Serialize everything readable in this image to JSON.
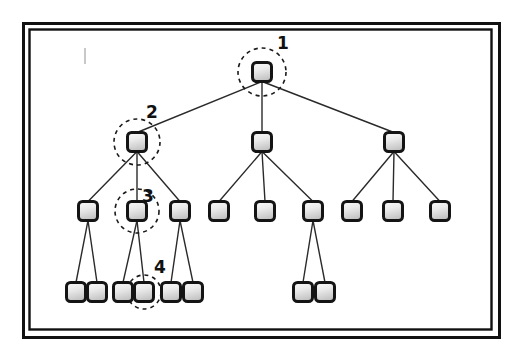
{
  "figure": {
    "background_color": "#ffffff",
    "frame": {
      "name": "double-line-rectangle-border",
      "outer_color": "#111111",
      "inner_color": "#111111",
      "gap_color": "#ffffff",
      "outer": {
        "x": 23,
        "y": 23,
        "width": 476,
        "height": 314
      },
      "inner": {
        "x": 29,
        "y": 29,
        "width": 462,
        "height": 300
      }
    },
    "node_style": {
      "shape": "rounded-square",
      "size": 19,
      "radius": 4,
      "border_color": "#141414",
      "border_width": 3,
      "fill_top": "#f2f2f2",
      "fill_bottom": "#c9c9c9"
    },
    "edge_style": {
      "color": "#2a2a2a",
      "width": 1.4
    },
    "highlight_style": {
      "shape": "dashed-circle",
      "color": "#1a1a1a",
      "radius": 22,
      "dash": "4 4",
      "width": 1.6
    },
    "stray_mark": {
      "x": 84,
      "y": 48,
      "width": 2,
      "height": 16,
      "color": "#c8c8c8"
    }
  },
  "chart_data": {
    "type": "tree",
    "title": "",
    "levels": 4,
    "node_count": 22,
    "nodes": [
      {
        "id": "n1",
        "label": "",
        "level": 1,
        "x": 262,
        "y": 72,
        "parent": null
      },
      {
        "id": "n2",
        "label": "",
        "level": 2,
        "x": 137,
        "y": 142,
        "parent": "n1"
      },
      {
        "id": "n3",
        "label": "",
        "level": 2,
        "x": 262,
        "y": 142,
        "parent": "n1"
      },
      {
        "id": "n4",
        "label": "",
        "level": 2,
        "x": 394,
        "y": 142,
        "parent": "n1"
      },
      {
        "id": "n5",
        "label": "",
        "level": 3,
        "x": 88,
        "y": 211,
        "parent": "n2"
      },
      {
        "id": "n6",
        "label": "",
        "level": 3,
        "x": 137,
        "y": 211,
        "parent": "n2"
      },
      {
        "id": "n7",
        "label": "",
        "level": 3,
        "x": 180,
        "y": 211,
        "parent": "n2"
      },
      {
        "id": "n8",
        "label": "",
        "level": 3,
        "x": 219,
        "y": 211,
        "parent": "n3"
      },
      {
        "id": "n9",
        "label": "",
        "level": 3,
        "x": 265,
        "y": 211,
        "parent": "n3"
      },
      {
        "id": "n10",
        "label": "",
        "level": 3,
        "x": 313,
        "y": 211,
        "parent": "n3"
      },
      {
        "id": "n11",
        "label": "",
        "level": 3,
        "x": 352,
        "y": 211,
        "parent": "n4"
      },
      {
        "id": "n12",
        "label": "",
        "level": 3,
        "x": 393,
        "y": 211,
        "parent": "n4"
      },
      {
        "id": "n13",
        "label": "",
        "level": 3,
        "x": 440,
        "y": 211,
        "parent": "n4"
      },
      {
        "id": "n14",
        "label": "",
        "level": 4,
        "x": 76,
        "y": 292,
        "parent": "n5"
      },
      {
        "id": "n15",
        "label": "",
        "level": 4,
        "x": 97,
        "y": 292,
        "parent": "n5"
      },
      {
        "id": "n16",
        "label": "",
        "level": 4,
        "x": 123,
        "y": 292,
        "parent": "n6"
      },
      {
        "id": "n17",
        "label": "",
        "level": 4,
        "x": 144,
        "y": 292,
        "parent": "n6"
      },
      {
        "id": "n18",
        "label": "",
        "level": 4,
        "x": 171,
        "y": 292,
        "parent": "n7"
      },
      {
        "id": "n19",
        "label": "",
        "level": 4,
        "x": 193,
        "y": 292,
        "parent": "n7"
      },
      {
        "id": "n20",
        "label": "",
        "level": 4,
        "x": 303,
        "y": 292,
        "parent": "n10"
      },
      {
        "id": "n21",
        "label": "",
        "level": 4,
        "x": 325,
        "y": 292,
        "parent": "n10"
      }
    ],
    "edges": [
      {
        "from": "n1",
        "to": "n2"
      },
      {
        "from": "n1",
        "to": "n3"
      },
      {
        "from": "n1",
        "to": "n4"
      },
      {
        "from": "n2",
        "to": "n5"
      },
      {
        "from": "n2",
        "to": "n6"
      },
      {
        "from": "n2",
        "to": "n7"
      },
      {
        "from": "n3",
        "to": "n8"
      },
      {
        "from": "n3",
        "to": "n9"
      },
      {
        "from": "n3",
        "to": "n10"
      },
      {
        "from": "n4",
        "to": "n11"
      },
      {
        "from": "n4",
        "to": "n12"
      },
      {
        "from": "n4",
        "to": "n13"
      },
      {
        "from": "n5",
        "to": "n14"
      },
      {
        "from": "n5",
        "to": "n15"
      },
      {
        "from": "n6",
        "to": "n16"
      },
      {
        "from": "n6",
        "to": "n17"
      },
      {
        "from": "n7",
        "to": "n18"
      },
      {
        "from": "n7",
        "to": "n19"
      },
      {
        "from": "n10",
        "to": "n20"
      },
      {
        "from": "n10",
        "to": "n21"
      }
    ],
    "highlights": [
      {
        "node": "n1",
        "annotation": "1",
        "label_x": 283,
        "label_y": 43,
        "cx": 262,
        "cy": 72,
        "r": 24
      },
      {
        "node": "n2",
        "annotation": "2",
        "label_x": 152,
        "label_y": 112,
        "cx": 137,
        "cy": 142,
        "r": 23
      },
      {
        "node": "n6",
        "annotation": "3",
        "label_x": 148,
        "label_y": 196,
        "cx": 137,
        "cy": 211,
        "r": 22
      },
      {
        "node": "n17",
        "annotation": "4",
        "label_x": 160,
        "label_y": 267,
        "cx": 144,
        "cy": 292,
        "r": 17
      }
    ],
    "annotation_labels": [
      "1",
      "2",
      "3",
      "4"
    ]
  }
}
